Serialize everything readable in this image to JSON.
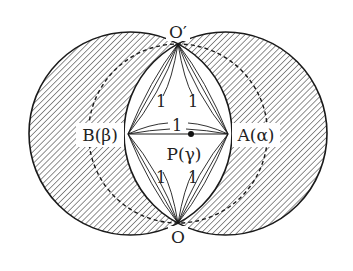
{
  "diagram": {
    "colors": {
      "stroke": "#1a1a1a",
      "hatch": "#555555",
      "background": "#ffffff",
      "label_bg": "#ffffff"
    },
    "geometry": {
      "left_circle": {
        "cx": 130.5,
        "cy": 133.5,
        "r": 101.5
      },
      "right_circle": {
        "cx": 225.5,
        "cy": 133.5,
        "r": 101.5
      },
      "dashed_circle": {
        "cx": 178,
        "cy": 133.5,
        "r": 89.5
      },
      "O_prime": {
        "x": 178,
        "y": 44
      },
      "O": {
        "x": 178,
        "y": 223
      },
      "B": {
        "x": 128,
        "y": 134
      },
      "A": {
        "x": 228,
        "y": 134
      },
      "P": {
        "x": 191,
        "y": 134
      }
    },
    "labels": {
      "O_prime": "O′",
      "O": "O",
      "B": "B(β)",
      "A": "A(α)",
      "P": "P(γ)",
      "edge_upper_left": "1",
      "edge_upper_right": "1",
      "edge_middle": "1",
      "edge_lower_left": "1",
      "edge_lower_right": "1"
    }
  }
}
